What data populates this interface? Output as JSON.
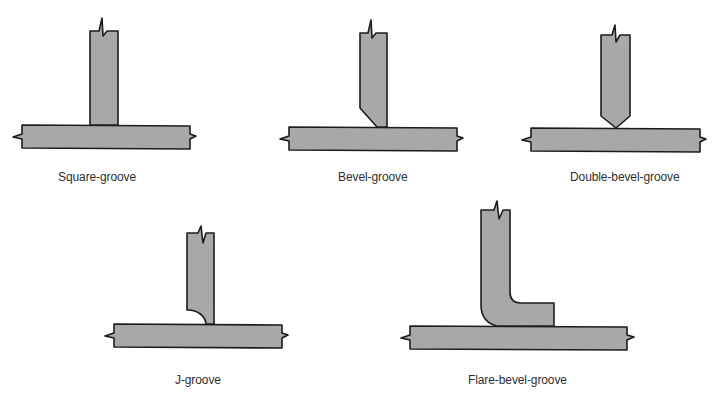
{
  "figure": {
    "colors": {
      "fill": "#a8a8a8",
      "stroke": "#1c1c1c",
      "text": "#2e2e2e",
      "background": "#ffffff"
    },
    "joints": [
      {
        "id": "square-groove",
        "label": "Square-groove"
      },
      {
        "id": "bevel-groove",
        "label": "Bevel-groove"
      },
      {
        "id": "double-bevel-groove",
        "label": "Double-bevel-groove"
      },
      {
        "id": "j-groove",
        "label": "J-groove"
      },
      {
        "id": "flare-bevel-groove",
        "label": "Flare-bevel-groove"
      }
    ]
  }
}
